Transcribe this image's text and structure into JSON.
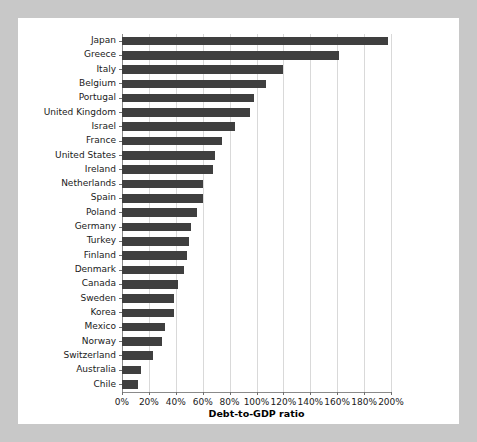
{
  "chart_data": {
    "type": "bar",
    "orientation": "horizontal",
    "title": "",
    "xlabel": "Debt-to-GDP ratio",
    "ylabel": "",
    "xlim": [
      0,
      200
    ],
    "xunit": "%",
    "grid": true,
    "legend": "none",
    "bar_color": "#3f3f3f",
    "background_color": "#ffffff",
    "page_background_color": "#c8c8c8",
    "xticks": [
      "0%",
      "20%",
      "40%",
      "60%",
      "80%",
      "100%",
      "120%",
      "140%",
      "160%",
      "180%",
      "200%"
    ],
    "xtick_values": [
      0,
      20,
      40,
      60,
      80,
      100,
      120,
      140,
      160,
      180,
      200
    ],
    "categories": [
      "Japan",
      "Greece",
      "Italy",
      "Belgium",
      "Portugal",
      "United Kingdom",
      "Israel",
      "France",
      "United States",
      "Ireland",
      "Netherlands",
      "Spain",
      "Poland",
      "Germany",
      "Turkey",
      "Finland",
      "Denmark",
      "Canada",
      "Sweden",
      "Korea",
      "Mexico",
      "Norway",
      "Switzerland",
      "Australia",
      "Chile"
    ],
    "values": [
      198,
      161,
      120,
      107,
      98,
      95,
      84,
      74,
      69,
      68,
      60,
      60,
      56,
      51,
      50,
      48,
      46,
      42,
      39,
      39,
      32,
      30,
      23,
      14,
      12
    ]
  }
}
